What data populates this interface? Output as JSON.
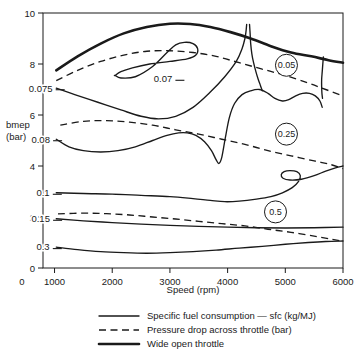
{
  "chart_data": {
    "type": "line",
    "title": "",
    "subtitle": "",
    "xlabel": "Speed (rpm)",
    "ylabel": "bmep (bar)",
    "xlim": [
      800,
      6000
    ],
    "ylim": [
      0,
      10
    ],
    "grid": false,
    "legend_position": "below-axes",
    "x_ticks": [
      0,
      1000,
      2000,
      3000,
      4000,
      5000,
      6000
    ],
    "x_tick_labels": [
      "0",
      "1000",
      "2000",
      "3000",
      "4000",
      "5000",
      "6000"
    ],
    "y_ticks": [
      0,
      2,
      4,
      6,
      8,
      10
    ],
    "y_tick_labels": [
      "0",
      "2",
      "4",
      "6",
      "8",
      "10"
    ],
    "legend": [
      {
        "label": "Specific fuel consumption — sfc (kg/MJ)",
        "style": "solid-thin"
      },
      {
        "label": "Pressure drop across throttle (bar)",
        "style": "dashed"
      },
      {
        "label": "Wide open throttle",
        "style": "solid-thick"
      }
    ],
    "series": [
      {
        "name": "sfc 0.07",
        "kind": "sfc-contour",
        "label": "0.07",
        "closed": true,
        "points": [
          [
            2050,
            7.55
          ],
          [
            2150,
            7.45
          ],
          [
            2400,
            7.5
          ],
          [
            2700,
            7.9
          ],
          [
            2950,
            8.45
          ],
          [
            3100,
            8.75
          ],
          [
            3250,
            8.85
          ],
          [
            3400,
            8.8
          ],
          [
            3480,
            8.6
          ],
          [
            3450,
            8.35
          ],
          [
            3300,
            8.2
          ],
          [
            3000,
            8.1
          ],
          [
            2650,
            8.0
          ],
          [
            2350,
            7.85
          ],
          [
            2150,
            7.7
          ],
          [
            2050,
            7.55
          ]
        ]
      },
      {
        "name": "sfc 0.075",
        "kind": "sfc-contour",
        "label": "0.075",
        "closed": false,
        "points": [
          [
            1030,
            7.05
          ],
          [
            1350,
            6.8
          ],
          [
            1750,
            6.5
          ],
          [
            2150,
            6.2
          ],
          [
            2500,
            5.95
          ],
          [
            2800,
            5.85
          ],
          [
            3100,
            5.95
          ],
          [
            3400,
            6.3
          ],
          [
            3700,
            6.9
          ],
          [
            3950,
            7.5
          ],
          [
            4150,
            8.1
          ],
          [
            4250,
            8.6
          ],
          [
            4300,
            9.0
          ],
          [
            4320,
            9.3
          ],
          [
            4330,
            9.55
          ]
        ]
      },
      {
        "name": "sfc 0.08",
        "kind": "sfc-contour",
        "label": "0.08",
        "closed": false,
        "points": [
          [
            1030,
            5.05
          ],
          [
            1250,
            4.75
          ],
          [
            1500,
            4.6
          ],
          [
            1800,
            4.55
          ],
          [
            2100,
            4.6
          ],
          [
            2400,
            4.75
          ],
          [
            2700,
            5.0
          ],
          [
            2950,
            5.2
          ],
          [
            3150,
            5.3
          ],
          [
            3300,
            5.3
          ],
          [
            3450,
            5.2
          ],
          [
            3600,
            4.95
          ],
          [
            3720,
            4.6
          ],
          [
            3800,
            4.25
          ],
          [
            3850,
            4.1
          ],
          [
            3900,
            4.35
          ],
          [
            3960,
            5.1
          ],
          [
            4030,
            5.9
          ],
          [
            4120,
            6.45
          ],
          [
            4250,
            6.8
          ],
          [
            4400,
            6.95
          ],
          [
            4550,
            7.0
          ],
          [
            4700,
            6.85
          ],
          [
            4820,
            6.65
          ],
          [
            4950,
            6.55
          ],
          [
            5060,
            6.6
          ],
          [
            5180,
            6.75
          ],
          [
            5300,
            6.85
          ],
          [
            5420,
            6.85
          ],
          [
            5520,
            6.75
          ],
          [
            5600,
            6.55
          ],
          [
            5640,
            6.3
          ]
        ]
      },
      {
        "name": "sfc 0.1",
        "kind": "sfc-contour",
        "label": "0.1",
        "closed": false,
        "points": [
          [
            1030,
            2.95
          ],
          [
            1500,
            2.92
          ],
          [
            2000,
            2.9
          ],
          [
            2500,
            2.85
          ],
          [
            3000,
            2.8
          ],
          [
            3400,
            2.72
          ],
          [
            3700,
            2.65
          ],
          [
            3950,
            2.6
          ],
          [
            4200,
            2.62
          ],
          [
            4500,
            2.7
          ],
          [
            4750,
            2.8
          ],
          [
            4950,
            2.95
          ],
          [
            5120,
            3.15
          ],
          [
            5230,
            3.4
          ],
          [
            5260,
            3.62
          ],
          [
            5200,
            3.78
          ],
          [
            5080,
            3.82
          ],
          [
            4980,
            3.78
          ],
          [
            4930,
            3.66
          ],
          [
            4960,
            3.52
          ],
          [
            5080,
            3.45
          ],
          [
            5280,
            3.48
          ],
          [
            5500,
            3.62
          ],
          [
            5700,
            3.8
          ],
          [
            5870,
            3.93
          ],
          [
            6000,
            4.0
          ]
        ]
      },
      {
        "name": "sfc 0.15",
        "kind": "sfc-contour",
        "label": "0.15",
        "closed": false,
        "points": [
          [
            1030,
            1.93
          ],
          [
            1500,
            1.85
          ],
          [
            2000,
            1.78
          ],
          [
            2500,
            1.72
          ],
          [
            3000,
            1.67
          ],
          [
            3500,
            1.63
          ],
          [
            4000,
            1.6
          ],
          [
            4500,
            1.58
          ],
          [
            5000,
            1.57
          ],
          [
            5500,
            1.58
          ],
          [
            6000,
            1.6
          ]
        ]
      },
      {
        "name": "sfc 0.3",
        "kind": "sfc-contour",
        "label": "0.3",
        "closed": false,
        "points": [
          [
            1030,
            0.82
          ],
          [
            1400,
            0.72
          ],
          [
            1800,
            0.64
          ],
          [
            2200,
            0.6
          ],
          [
            2600,
            0.58
          ],
          [
            3000,
            0.6
          ],
          [
            3400,
            0.64
          ],
          [
            3800,
            0.7
          ],
          [
            4200,
            0.78
          ],
          [
            4600,
            0.85
          ],
          [
            5000,
            0.93
          ],
          [
            5400,
            1.0
          ],
          [
            5700,
            1.04
          ],
          [
            6000,
            1.06
          ]
        ]
      },
      {
        "name": "throttle 0.05",
        "kind": "throttle-contour",
        "label": "0.05",
        "circled": true,
        "points": [
          [
            1030,
            7.35
          ],
          [
            1400,
            7.75
          ],
          [
            1800,
            8.1
          ],
          [
            2200,
            8.35
          ],
          [
            2600,
            8.5
          ],
          [
            3000,
            8.52
          ],
          [
            3400,
            8.45
          ],
          [
            3800,
            8.3
          ],
          [
            4200,
            8.05
          ],
          [
            4600,
            7.8
          ],
          [
            5000,
            7.55
          ],
          [
            5400,
            7.25
          ],
          [
            5700,
            7.0
          ],
          [
            6000,
            6.75
          ]
        ]
      },
      {
        "name": "throttle 0.25",
        "kind": "throttle-contour",
        "label": "0.25",
        "circled": true,
        "points": [
          [
            1100,
            5.6
          ],
          [
            1500,
            5.75
          ],
          [
            1900,
            5.78
          ],
          [
            2300,
            5.72
          ],
          [
            2700,
            5.6
          ],
          [
            3100,
            5.42
          ],
          [
            3500,
            5.25
          ],
          [
            3900,
            5.05
          ],
          [
            4300,
            4.85
          ],
          [
            4700,
            4.6
          ],
          [
            5100,
            4.4
          ],
          [
            5500,
            4.2
          ],
          [
            5800,
            4.05
          ],
          [
            6000,
            3.9
          ]
        ]
      },
      {
        "name": "throttle 0.5",
        "kind": "throttle-contour",
        "label": "0.5",
        "circled": true,
        "points": [
          [
            1060,
            2.12
          ],
          [
            1500,
            2.15
          ],
          [
            1900,
            2.13
          ],
          [
            2300,
            2.08
          ],
          [
            2700,
            2.0
          ],
          [
            3100,
            1.92
          ],
          [
            3500,
            1.83
          ],
          [
            3900,
            1.74
          ],
          [
            4300,
            1.65
          ],
          [
            4700,
            1.52
          ],
          [
            5100,
            1.4
          ],
          [
            5500,
            1.25
          ],
          [
            5800,
            1.13
          ],
          [
            6000,
            1.05
          ]
        ]
      },
      {
        "name": "Wide open throttle",
        "kind": "wot",
        "points": [
          [
            1030,
            7.75
          ],
          [
            1400,
            8.3
          ],
          [
            1800,
            8.8
          ],
          [
            2200,
            9.2
          ],
          [
            2600,
            9.45
          ],
          [
            3000,
            9.58
          ],
          [
            3350,
            9.57
          ],
          [
            3700,
            9.45
          ],
          [
            4050,
            9.25
          ],
          [
            4400,
            9.0
          ],
          [
            4750,
            8.7
          ],
          [
            5100,
            8.45
          ],
          [
            5450,
            8.3
          ],
          [
            5750,
            8.15
          ],
          [
            6000,
            8.05
          ]
        ]
      },
      {
        "name": "wot-boundary-left",
        "kind": "sfc-contour",
        "points": [
          [
            4380,
            9.55
          ],
          [
            4390,
            9.2
          ],
          [
            4400,
            8.8
          ],
          [
            4420,
            8.4
          ],
          [
            4450,
            8.05
          ],
          [
            4490,
            7.7
          ],
          [
            4530,
            7.4
          ],
          [
            4570,
            7.15
          ],
          [
            4600,
            6.95
          ]
        ]
      },
      {
        "name": "wot-boundary-right",
        "kind": "sfc-contour",
        "points": [
          [
            5660,
            8.28
          ],
          [
            5650,
            8.0
          ],
          [
            5640,
            7.7
          ],
          [
            5630,
            7.4
          ],
          [
            5630,
            7.1
          ],
          [
            5635,
            6.85
          ],
          [
            5645,
            6.65
          ]
        ]
      }
    ],
    "contour_labels": [
      {
        "text": "0.07",
        "x": 2880,
        "y": 7.42,
        "leader": true
      },
      {
        "text": "0.075",
        "x": 760,
        "y": 7.05,
        "leader": true
      },
      {
        "text": "0.08",
        "x": 760,
        "y": 5.05,
        "leader": true
      },
      {
        "text": "0.1",
        "x": 800,
        "y": 2.95,
        "leader": true
      },
      {
        "text": "0.15",
        "x": 760,
        "y": 1.93,
        "leader": true
      },
      {
        "text": "0.3",
        "x": 800,
        "y": 0.82,
        "leader": true
      }
    ],
    "circled_labels": [
      {
        "text": "0.05",
        "x": 5020,
        "y": 7.95
      },
      {
        "text": "0.25",
        "x": 5020,
        "y": 5.25
      },
      {
        "text": "0.5",
        "x": 4830,
        "y": 2.2
      }
    ]
  },
  "colors": {
    "background": "#ffffff",
    "ink": "#1a1a1a"
  }
}
